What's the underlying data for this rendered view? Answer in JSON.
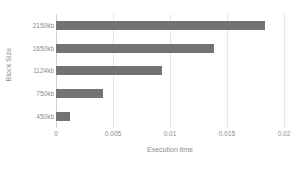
{
  "chart_data": {
    "type": "bar",
    "orientation": "horizontal",
    "title": "",
    "xlabel": "Execution time",
    "ylabel": "Block Size",
    "categories": [
      "450kb",
      "750kb",
      "1124kb",
      "1650kb",
      "2150kb"
    ],
    "values": [
      0.0012,
      0.0041,
      0.0093,
      0.0139,
      0.0183
    ],
    "series": [
      {
        "name": "Execution time",
        "values": [
          0.0012,
          0.0041,
          0.0093,
          0.0139,
          0.0183
        ]
      }
    ],
    "xlim": [
      0,
      0.02
    ],
    "xticks": [
      0,
      0.005,
      0.01,
      0.015,
      0.02
    ],
    "xtick_labels": [
      "0",
      "0.005",
      "0.01",
      "0.015",
      "0.02"
    ],
    "grid": true,
    "grid_axis": "x",
    "legend": false,
    "legend_position": "none",
    "bar_color": "#737373",
    "gridline_color": "#e6e6e6",
    "text_color": "#8c8c8c",
    "background_color": "#ffffff"
  }
}
